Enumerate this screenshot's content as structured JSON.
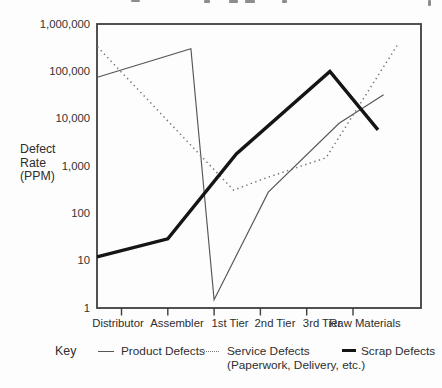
{
  "page": {
    "background": "#fdfdfd",
    "top_edge_note": "illegible cropped text fragments along the top edge of the scan"
  },
  "chart_data": {
    "type": "line",
    "title": "",
    "x_unit": "category index: 0=Distributor, 1=Assembler, 2=1st Tier, 3=2nd Tier, 4=3rd Tier, 5=Raw Materials (fractional x = position along the drawn polyline, which extends to the plot borders)",
    "y_axis": {
      "title_lines": [
        "Defect",
        "Rate",
        "(PPM)"
      ],
      "scale": "log",
      "tick_labels": [
        "1,000,000",
        "100,000",
        "10,000",
        "1,000",
        "100",
        "10",
        "1"
      ],
      "range": [
        1,
        1000000
      ],
      "gridlines": false
    },
    "x_axis": {
      "categories": [
        "Distributor",
        "Assembler",
        "1st Tier",
        "2nd Tier",
        "3rd Tier",
        "Raw Materials"
      ]
    },
    "legend": {
      "key_label": "Key",
      "position": "bottom"
    },
    "series": [
      {
        "name": "Product Defects",
        "line_style": "thin-solid",
        "color": "#565656",
        "points": [
          {
            "x": -0.52,
            "ppm": 75000
          },
          {
            "x": 1.5,
            "ppm": 300000
          },
          {
            "x": 2.0,
            "ppm": 1.5
          },
          {
            "x": 3.17,
            "ppm": 280
          },
          {
            "x": 4.7,
            "ppm": 8000
          },
          {
            "x": 5.66,
            "ppm": 32000
          }
        ]
      },
      {
        "name": "Service Defects",
        "subtitle": "(Paperwork, Delivery, etc.)",
        "line_style": "dotted",
        "color": "#787878",
        "points": [
          {
            "x": -0.52,
            "ppm": 330000
          },
          {
            "x": 2.42,
            "ppm": 310
          },
          {
            "x": 3.1,
            "ppm": 550
          },
          {
            "x": 4.42,
            "ppm": 1500
          },
          {
            "x": 5.95,
            "ppm": 350000
          }
        ]
      },
      {
        "name": "Scrap Defects",
        "line_style": "thick-solid",
        "color": "#151515",
        "points": [
          {
            "x": -0.53,
            "ppm": 12
          },
          {
            "x": 1.0,
            "ppm": 29
          },
          {
            "x": 2.48,
            "ppm": 1800
          },
          {
            "x": 4.5,
            "ppm": 100000
          },
          {
            "x": 5.54,
            "ppm": 5800
          }
        ]
      }
    ]
  }
}
